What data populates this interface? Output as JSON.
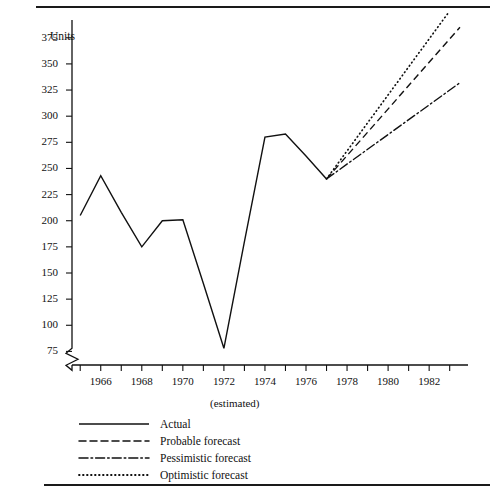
{
  "chart_data": {
    "type": "line",
    "title": "",
    "xlabel": "(estimated)",
    "ylabel": "Units",
    "xlim": [
      1964.6,
      1983.6
    ],
    "ylim": [
      62,
      392
    ],
    "grid": false,
    "y_axis_break": true,
    "legend_position": "below-left",
    "y_ticks": [
      75,
      100,
      125,
      150,
      175,
      200,
      225,
      250,
      275,
      300,
      325,
      350,
      375
    ],
    "x_ticks": [
      1965,
      1966,
      1967,
      1968,
      1969,
      1970,
      1971,
      1972,
      1973,
      1974,
      1975,
      1976,
      1977,
      1978,
      1979,
      1980,
      1981,
      1982,
      1983
    ],
    "x_tick_labels": [
      "",
      "1966",
      "",
      "1968",
      "",
      "1970",
      "",
      "1972",
      "",
      "1974",
      "",
      "1976",
      "",
      "1978",
      "",
      "1980",
      "",
      "1982",
      ""
    ],
    "series": [
      {
        "name": "Actual",
        "style": "solid",
        "x": [
          1965,
          1966,
          1967,
          1968,
          1969,
          1970,
          1971,
          1972,
          1973,
          1974,
          1975,
          1976,
          1977
        ],
        "values": [
          205,
          243,
          208,
          175,
          200,
          201,
          140,
          78,
          180,
          280,
          283,
          262,
          240
        ]
      },
      {
        "name": "Probable forecast",
        "style": "dashed",
        "x": [
          1977,
          1983.5
        ],
        "values": [
          240,
          385
        ]
      },
      {
        "name": "Pessimistic forecast",
        "style": "dash-dot",
        "x": [
          1977,
          1983.5
        ],
        "values": [
          240,
          332
        ]
      },
      {
        "name": "Optimistic forecast",
        "style": "dotted",
        "x": [
          1977,
          1982.9
        ],
        "values": [
          240,
          398
        ]
      }
    ]
  },
  "axes": {
    "y_title": "Units",
    "x_note": "(estimated)"
  },
  "legend": {
    "items": [
      {
        "label": "Actual",
        "key": "line-solid-key"
      },
      {
        "label": "Probable forecast",
        "key": "line-dashed-key"
      },
      {
        "label": "Pessimistic forecast",
        "key": "line-dash-dot-key"
      },
      {
        "label": "Optimistic forecast",
        "key": "line-dotted-key"
      }
    ]
  },
  "colors": {
    "ink": "#111111",
    "background": "#ffffff"
  }
}
